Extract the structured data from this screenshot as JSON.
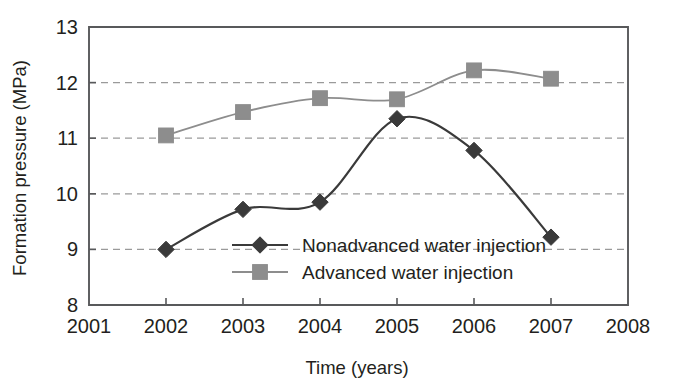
{
  "chart_data": {
    "type": "line",
    "title": "",
    "xlabel": "Time (years)",
    "ylabel": "Formation pressure (MPa)",
    "x": [
      2002,
      2003,
      2004,
      2005,
      2006,
      2007
    ],
    "xlim": [
      2001,
      2008
    ],
    "ylim": [
      8,
      13
    ],
    "xticks": [
      2001,
      2002,
      2003,
      2004,
      2005,
      2006,
      2007,
      2008
    ],
    "xtick_labels": [
      "2001",
      "2002",
      "2003",
      "2004",
      "2005",
      "2006",
      "2007",
      "2008"
    ],
    "yticks": [
      8,
      9,
      10,
      11,
      12,
      13
    ],
    "ytick_labels": [
      "8",
      "9",
      "10",
      "11",
      "12",
      "13"
    ],
    "grid": true,
    "grid_axis": "y",
    "grid_style": "dashed",
    "grid_values": [
      9,
      10,
      11,
      12
    ],
    "legend_position": "center-inside",
    "line_style": "smooth-spline",
    "series": [
      {
        "name": "Nonadvanced water injection",
        "marker": "diamond",
        "color": "#3a3a3a",
        "values": [
          9.0,
          9.72,
          9.85,
          11.35,
          10.78,
          9.22
        ]
      },
      {
        "name": "Advanced water injection",
        "marker": "square",
        "color": "#8d8d8d",
        "values": [
          11.05,
          11.47,
          11.72,
          11.7,
          12.22,
          12.07
        ]
      }
    ]
  },
  "axes": {
    "y_title": "Formation pressure (MPa)",
    "x_title": "Time (years)",
    "y_ticks": [
      {
        "value": 13,
        "label": "13"
      },
      {
        "value": 12,
        "label": "12"
      },
      {
        "value": 11,
        "label": "11"
      },
      {
        "value": 10,
        "label": "10"
      },
      {
        "value": 9,
        "label": "9"
      },
      {
        "value": 8,
        "label": "8"
      }
    ],
    "x_ticks": [
      {
        "value": 2001,
        "label": "2001"
      },
      {
        "value": 2002,
        "label": "2002"
      },
      {
        "value": 2003,
        "label": "2003"
      },
      {
        "value": 2004,
        "label": "2004"
      },
      {
        "value": 2005,
        "label": "2005"
      },
      {
        "value": 2006,
        "label": "2006"
      },
      {
        "value": 2007,
        "label": "2007"
      },
      {
        "value": 2008,
        "label": "2008"
      }
    ]
  },
  "legend": {
    "entries": [
      {
        "label": "Nonadvanced water injection",
        "marker": "diamond",
        "color": "#3a3a3a"
      },
      {
        "label": "Advanced water injection",
        "marker": "square",
        "color": "#8d8d8d"
      }
    ]
  },
  "colors": {
    "frame": "#58595b",
    "grid": "#9a9a9a",
    "series_nonadvanced": "#3a3a3a",
    "series_advanced": "#8d8d8d",
    "background": "#ffffff",
    "text": "#231f20"
  }
}
